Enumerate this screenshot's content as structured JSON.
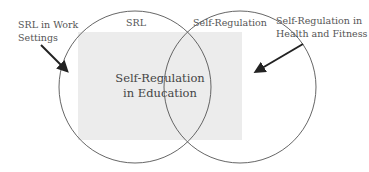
{
  "diagram": {
    "circles": {
      "left": {
        "label": "SRL"
      },
      "right": {
        "label": "Self-Regulation"
      }
    },
    "intersection": {
      "line1": "Self-Regulation",
      "line2": "in Education"
    },
    "callouts": {
      "left": {
        "line1": "SRL in Work",
        "line2": "Settings"
      },
      "right": {
        "line1": "Self-Regulation in",
        "line2": "Health and Fitness"
      }
    },
    "colors": {
      "circle_stroke": "#555555",
      "region_fill": "#ececec",
      "arrow": "#222222",
      "text": "#555555"
    }
  }
}
